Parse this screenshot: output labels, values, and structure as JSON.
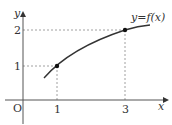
{
  "diagram": {
    "type": "function-graph",
    "curve_label": "y=f(x)",
    "axes": {
      "x_label": "x",
      "y_label": "y",
      "origin_label": "O"
    },
    "x_ticks": [
      "1",
      "3"
    ],
    "y_ticks": [
      "1",
      "2"
    ],
    "points": [
      {
        "x": 1,
        "y": 1
      },
      {
        "x": 3,
        "y": 2
      }
    ],
    "colors": {
      "curve": "#333333",
      "axis": "#555555",
      "guide": "#888888"
    }
  }
}
